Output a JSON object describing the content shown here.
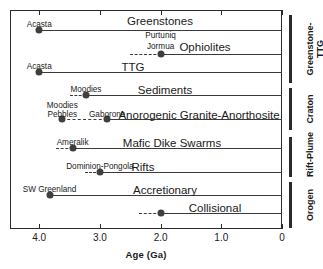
{
  "chart_data": {
    "type": "bar",
    "title": "",
    "xlabel": "Age (Ga)",
    "ylabel": "",
    "xlim": [
      4.48,
      0
    ],
    "axis_direction": "reversed",
    "tick_values": [
      4.0,
      3.0,
      2.0,
      1.0,
      0
    ],
    "tick_labels": [
      "4.0",
      "3.0",
      "2.0",
      "1.0",
      "0"
    ],
    "grid": false,
    "legend": null,
    "note": "Horizontal range bars showing oldest-known occurrence (dot) of each rock association, extending to present (0 Ga). Dashed segments denote uncertain older extent.",
    "categories": [
      "Greenstones",
      "Ophiolites",
      "TTG",
      "Sediments",
      "Anorogenic Granite-Anorthosite",
      "Mafic Dike Swarms",
      "Rifts",
      "Accretionary",
      "Collisional"
    ],
    "series": [
      {
        "name": "Greenstones",
        "label": "Greenstones",
        "start_ga": 4.0,
        "end_ga": 0,
        "dot_ga": 4.0,
        "dash_from_ga": null,
        "point_labels": [
          {
            "text": "Acasta",
            "ga": 4.0
          }
        ]
      },
      {
        "name": "Ophiolites",
        "label": "Ophiolites",
        "start_ga": 2.0,
        "end_ga": 0,
        "dot_ga": 2.0,
        "dash_from_ga": 2.5,
        "point_labels": [
          {
            "text": "Purtuniq",
            "ga": 2.0
          },
          {
            "text": "Jormua",
            "ga": 2.0
          }
        ]
      },
      {
        "name": "TTG",
        "label": "TTG",
        "start_ga": 4.0,
        "end_ga": 0,
        "dot_ga": 4.0,
        "dash_from_ga": null,
        "point_labels": [
          {
            "text": "Acasta",
            "ga": 4.0
          }
        ]
      },
      {
        "name": "Sediments",
        "label": "Sediments",
        "start_ga": 3.23,
        "end_ga": 0,
        "dot_ga": 3.23,
        "dash_from_ga": 3.5,
        "point_labels": [
          {
            "text": "Moodies",
            "ga": 3.23
          }
        ]
      },
      {
        "name": "Anorogenic Granite-Anorthosite",
        "label": "Anorogenic Granite-Anorthosite",
        "start_ga": 2.88,
        "end_ga": 0,
        "dot_ga": 2.88,
        "dash_from_ga": 3.62,
        "extra_dot_ga": 3.62,
        "point_labels": [
          {
            "text": "Moodies",
            "ga": 3.62
          },
          {
            "text": "Pebbles",
            "ga": 3.62
          },
          {
            "text": "Gaborone",
            "ga": 2.88
          }
        ]
      },
      {
        "name": "Mafic Dike Swarms",
        "label": "Mafic Dike Swarms",
        "start_ga": 3.45,
        "end_ga": 0,
        "dot_ga": 3.45,
        "dash_from_ga": 3.72,
        "point_labels": [
          {
            "text": "Ameralik",
            "ga": 3.45
          }
        ]
      },
      {
        "name": "Rifts",
        "label": "Rifts",
        "start_ga": 3.0,
        "end_ga": 0,
        "dot_ga": 3.0,
        "dash_from_ga": 3.25,
        "point_labels": [
          {
            "text": "Dominion-Pongola",
            "ga": 3.0
          }
        ]
      },
      {
        "name": "Accretionary",
        "label": "Accretionary",
        "start_ga": 3.83,
        "end_ga": 0,
        "dot_ga": 3.83,
        "dash_from_ga": null,
        "point_labels": [
          {
            "text": "SW Greenland",
            "ga": 3.83
          }
        ]
      },
      {
        "name": "Collisional",
        "label": "Collisional",
        "start_ga": 2.0,
        "end_ga": 0,
        "dot_ga": 2.0,
        "dash_from_ga": 2.35,
        "point_labels": [
          {
            "text": "",
            "ga": 2.0
          }
        ]
      }
    ],
    "groups": [
      {
        "label": "Greenstone-\nTTG",
        "members": [
          "Greenstones",
          "Ophiolites",
          "TTG"
        ]
      },
      {
        "label": "Craton",
        "members": [
          "Sediments",
          "Anorogenic Granite-Anorthosite"
        ]
      },
      {
        "label": "Rift-Plume",
        "members": [
          "Mafic Dike Swarms",
          "Rifts"
        ]
      },
      {
        "label": "Orogen",
        "members": [
          "Accretionary",
          "Collisional"
        ]
      }
    ]
  },
  "layout": {
    "rows": [
      {
        "name": "Greenstones",
        "y": 30,
        "title_x": 160,
        "title_y": 15,
        "labels_y": [
          20
        ]
      },
      {
        "name": "Ophiolites",
        "y": 54,
        "title_x": 205,
        "title_y": 41,
        "labels_y": [
          31,
          42
        ]
      },
      {
        "name": "TTG",
        "y": 72,
        "title_x": 133,
        "title_y": 61,
        "labels_y": [
          62
        ]
      },
      {
        "name": "Sediments",
        "y": 95,
        "title_x": 165,
        "title_y": 84,
        "labels_y": [
          85
        ]
      },
      {
        "name": "Anorogenic Granite-Anorthosite",
        "y": 119,
        "title_x": 199,
        "title_y": 109,
        "labels_y": [
          101,
          110,
          110
        ]
      },
      {
        "name": "Mafic Dike Swarms",
        "y": 148,
        "title_x": 172,
        "title_y": 137,
        "labels_y": [
          138
        ]
      },
      {
        "name": "Rifts",
        "y": 172,
        "title_x": 143,
        "title_y": 161,
        "labels_y": [
          162
        ]
      },
      {
        "name": "Accretionary",
        "y": 195,
        "title_x": 165,
        "title_y": 184,
        "labels_y": [
          185
        ]
      },
      {
        "name": "Collisional",
        "y": 213,
        "title_x": 215,
        "title_y": 202,
        "labels_y": [
          203
        ]
      }
    ],
    "brackets": [
      {
        "label_line1": "Greenstone-",
        "label_line2": "TTG",
        "top": 15,
        "bottom": 83
      },
      {
        "label_line1": "Craton",
        "label_line2": "",
        "top": 88,
        "bottom": 130
      },
      {
        "label_line1": "Rift-Plume",
        "label_line2": "",
        "top": 137,
        "bottom": 177
      },
      {
        "label_line1": "Orogen",
        "label_line2": "",
        "top": 182,
        "bottom": 228
      }
    ]
  }
}
